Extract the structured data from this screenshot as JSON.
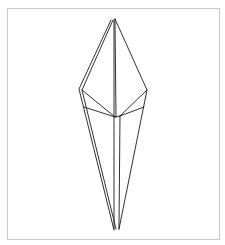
{
  "diagram": {
    "type": "origami-fold-diagram",
    "frame_color": "#c8c8c8",
    "line_color": "#1a1a1a",
    "background": "#ffffff"
  }
}
